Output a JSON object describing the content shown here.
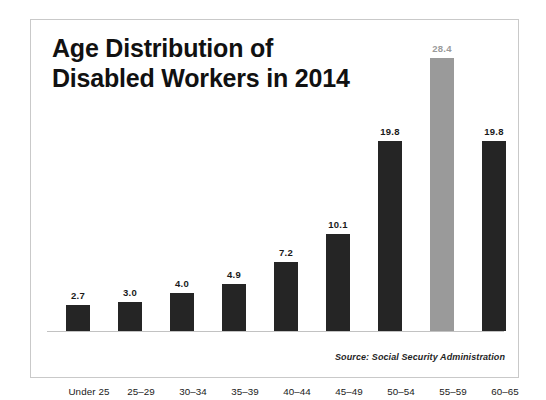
{
  "card": {
    "border_color": "#c9c9c9",
    "background": "#ffffff"
  },
  "title": "Age Distribution of\nDisabled Workers in 2014",
  "source_note": "Source: Social Security Administration",
  "colors": {
    "bar_default": "#252525",
    "bar_highlight": "#9a9a9a",
    "axis_line": "#c2c2c2",
    "text": "#1a1a1a"
  },
  "chart_data": {
    "type": "bar",
    "title": "Age Distribution of Disabled Workers in 2014",
    "xlabel": "",
    "ylabel": "",
    "ylim": [
      0,
      30
    ],
    "grid": false,
    "legend": "none",
    "value_labels_shown": true,
    "axis_labels_shown": false,
    "categories": [
      "Under 25",
      "25–29",
      "30–34",
      "35–39",
      "40–44",
      "45–49",
      "50–54",
      "55–59",
      "60–65"
    ],
    "values": [
      2.7,
      3.0,
      4.0,
      4.9,
      7.2,
      10.1,
      19.8,
      28.4,
      19.8
    ],
    "value_label_text": [
      "2.7",
      "3.0",
      "4.0",
      "4.9",
      "7.2",
      "10.1",
      "19.8",
      "28.4",
      "19.8"
    ],
    "highlighted_index": 7,
    "annotation": "Source: Social Security Administration"
  }
}
